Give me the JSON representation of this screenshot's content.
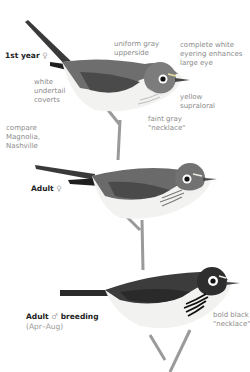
{
  "plates": [
    {
      "age_label": "1st year",
      "sex_symbol": "♀",
      "annotations": [
        {
          "id": "uniform-gray-upperside",
          "lines": [
            "uniform gray",
            "upperside"
          ]
        },
        {
          "id": "complete-white-eyering",
          "lines": [
            "complete white",
            "eyering enhances",
            "large eye"
          ]
        },
        {
          "id": "white-undertail-coverts",
          "lines": [
            "white",
            "undertail",
            "coverts"
          ]
        },
        {
          "id": "yellow-supraloral",
          "lines": [
            "yellow",
            "supraloral"
          ]
        },
        {
          "id": "compare-note",
          "lines": [
            "compare",
            "Magnolia,",
            "Nashville"
          ]
        },
        {
          "id": "faint-gray-necklace",
          "lines": [
            "faint gray",
            "\"necklace\""
          ]
        }
      ]
    },
    {
      "age_label": "Adult",
      "sex_symbol": "♀",
      "annotations": []
    },
    {
      "age_label": "Adult",
      "sex_symbol": "♂",
      "age_label_suffix": "breeding",
      "season": "(Apr–Aug)",
      "annotations": [
        {
          "id": "bold-black-necklace",
          "lines": [
            "bold black",
            "\"necklace\""
          ]
        }
      ]
    }
  ],
  "colors": {
    "label_text": "#8a8a8a",
    "heading_text": "#222222",
    "bird_dark": "#3a3a3a",
    "bird_mid": "#6e6e6e",
    "belly": "#f2f2f0",
    "supraloral": "#e8e0a0"
  }
}
